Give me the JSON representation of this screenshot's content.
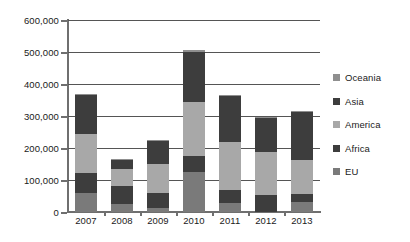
{
  "chart_data": {
    "type": "bar",
    "title": "",
    "subtitle": "",
    "xlabel": "",
    "ylabel": "",
    "stacked": true,
    "grid": true,
    "legend_position": "right",
    "ylim": [
      0,
      600000
    ],
    "ytick_values": [
      0,
      100000,
      200000,
      300000,
      400000,
      500000,
      600000
    ],
    "ytick_labels": [
      "0",
      "100,000",
      "200,000",
      "300,000",
      "400,000",
      "500,000",
      "600,000"
    ],
    "categories": [
      "2007",
      "2008",
      "2009",
      "2010",
      "2011",
      "2012",
      "2013"
    ],
    "series": [
      {
        "name": "EU",
        "color": "#7a7a7a",
        "values": [
          58000,
          25000,
          13000,
          125000,
          28000,
          0,
          30000
        ]
      },
      {
        "name": "Africa",
        "color": "#3d3d3d",
        "values": [
          64000,
          55000,
          46000,
          50000,
          42000,
          52000,
          25000
        ]
      },
      {
        "name": "America",
        "color": "#a8a8a8",
        "values": [
          123000,
          53000,
          91000,
          170000,
          148000,
          136000,
          108000
        ]
      },
      {
        "name": "Asia",
        "color": "#3d3d3d",
        "values": [
          120000,
          30000,
          75000,
          155000,
          144000,
          109000,
          149000
        ]
      },
      {
        "name": "Oceania",
        "color": "#8f8f8f",
        "values": [
          3000,
          2000,
          1000,
          5000,
          3000,
          1000,
          3000
        ]
      }
    ],
    "totals": [
      368000,
      165000,
      226000,
      505000,
      365000,
      298000,
      315000
    ]
  },
  "legend": {
    "items": [
      {
        "label": "Oceania",
        "color": "#8f8f8f"
      },
      {
        "label": "Asia",
        "color": "#3d3d3d"
      },
      {
        "label": "America",
        "color": "#a8a8a8"
      },
      {
        "label": "Africa",
        "color": "#3d3d3d"
      },
      {
        "label": "EU",
        "color": "#7a7a7a"
      }
    ]
  },
  "axes": {
    "y_max_label": "600,000",
    "y_min_label": "0"
  }
}
